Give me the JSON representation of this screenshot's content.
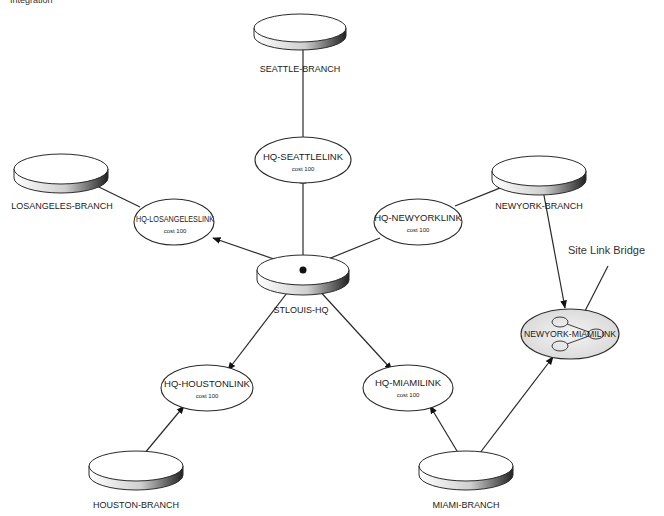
{
  "caption": "Integration",
  "diagram": {
    "sites": [
      {
        "id": "seattle",
        "label": "SEATTLE-BRANCH",
        "cx": 300,
        "cy": 28
      },
      {
        "id": "losangeles",
        "label": "LOSANGELES-BRANCH",
        "cx": 60,
        "cy": 170
      },
      {
        "id": "newyork",
        "label": "NEWYORK-BRANCH",
        "cx": 540,
        "cy": 170
      },
      {
        "id": "stlouis",
        "label": "STLOUIS-HQ",
        "cx": 303,
        "cy": 272
      },
      {
        "id": "houston",
        "label": "HOUSTON-BRANCH",
        "cx": 135,
        "cy": 468
      },
      {
        "id": "miami",
        "label": "MIAMI-BRANCH",
        "cx": 465,
        "cy": 468
      }
    ],
    "links": [
      {
        "id": "hq-seattle",
        "label": "HQ-SEATTLELINK",
        "cost": "cost 100",
        "cx": 303,
        "cy": 160
      },
      {
        "id": "hq-losangeles",
        "label": "HQ-LOSANGELESLINK",
        "cost": "cost 100",
        "cx": 175,
        "cy": 222
      },
      {
        "id": "hq-newyork",
        "label": "HQ-NEWYORKLINK",
        "cost": "cost 100",
        "cx": 418,
        "cy": 222
      },
      {
        "id": "hq-houston",
        "label": "HQ-HOUSTONLINK",
        "cost": "cost 100",
        "cx": 207,
        "cy": 388
      },
      {
        "id": "hq-miami",
        "label": "HQ-MIAMILINK",
        "cost": "cost 100",
        "cx": 408,
        "cy": 388
      }
    ],
    "bridge": {
      "label": "NEWYORK-MIAMILINK",
      "callout": "Site Link Bridge",
      "cx": 570,
      "cy": 334
    },
    "colors": {
      "stroke": "#2a2a2a",
      "fill": "#ffffff",
      "bridge_fill": "#e6e6e6",
      "shadow": "#555555"
    }
  }
}
